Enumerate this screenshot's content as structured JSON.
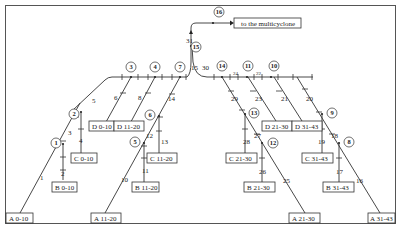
{
  "diagram": {
    "destination_label": "to the multicyclone",
    "nodes": [
      "1",
      "2",
      "3",
      "4",
      "5",
      "6",
      "7",
      "8",
      "9",
      "10",
      "11",
      "12",
      "13",
      "14",
      "15",
      "16"
    ],
    "segments": [
      "1",
      "2",
      "3",
      "4",
      "5",
      "6",
      "7",
      "8",
      "9",
      "10",
      "11",
      "12",
      "13",
      "14",
      "15",
      "16",
      "17",
      "18",
      "19",
      "20",
      "21",
      "22",
      "23",
      "24",
      "25",
      "26",
      "27",
      "28",
      "29",
      "30",
      "31"
    ],
    "sources": {
      "A": [
        "A 0-10",
        "A 11-20",
        "A 21-30",
        "A 31-43"
      ],
      "B": [
        "B 0-10",
        "B 11-20",
        "B 21-30",
        "B 31-43"
      ],
      "C": [
        "C 0-10",
        "C 11-20",
        "C 21-30",
        "C 31-43"
      ],
      "D": [
        "D 0-10",
        "D 11-20",
        "D 21-30",
        "D 31-43"
      ]
    },
    "colors": {
      "line": "#333333",
      "background": "#ffffff",
      "frame": "#555555"
    }
  }
}
